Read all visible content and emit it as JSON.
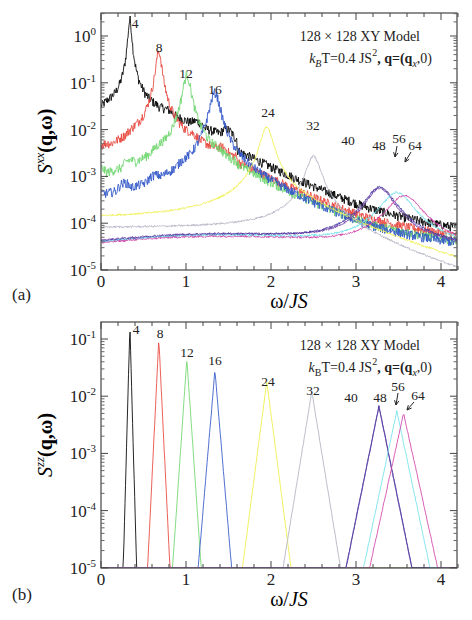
{
  "chart_data": [
    {
      "panel": "(a)",
      "type": "line",
      "title": "",
      "annotation_line1": "128 × 128 XY Model",
      "annotation_line2": "k_B T=0.4 JS², q=(q_x,0)",
      "xlabel": "ω/JS",
      "ylabel": "S^xx(q,ω)",
      "xlim": [
        0,
        4.2
      ],
      "ylim": [
        1e-05,
        3
      ],
      "yscale": "log",
      "xticks": [
        "0",
        "1",
        "2",
        "3",
        "4"
      ],
      "yticks": [
        "10^-5",
        "10^-4",
        "10^-3",
        "10^-2",
        "10^-1",
        "10^0"
      ],
      "grid": false,
      "legend": "inline peak labels (q_x index)",
      "series": [
        {
          "name": "4",
          "color": "#000000",
          "peak_omega": 0.34,
          "peak_value": 2.0,
          "background": 0.003
        },
        {
          "name": "8",
          "color": "#e8453c",
          "peak_omega": 0.68,
          "peak_value": 0.42,
          "background": 0.0008
        },
        {
          "name": "12",
          "color": "#6fd66f",
          "peak_omega": 1.01,
          "peak_value": 0.13,
          "background": 0.0005
        },
        {
          "name": "16",
          "color": "#3056c8",
          "peak_omega": 1.34,
          "peak_value": 0.055,
          "background": 0.00023
        },
        {
          "name": "24",
          "color": "#f0f05a",
          "peak_omega": 1.95,
          "peak_value": 0.011,
          "background": 0.00013
        },
        {
          "name": "32",
          "color": "#b8b8c8",
          "peak_omega": 2.5,
          "peak_value": 0.0026,
          "background": 8e-05
        },
        {
          "name": "40",
          "color": "#6f3fa8",
          "peak_omega": 3.28,
          "peak_value": 0.00052,
          "background": 4.2e-05
        },
        {
          "name": "48",
          "color": "#4a3aa0",
          "peak_omega": 3.28,
          "peak_value": 0.00055,
          "background": 4e-05
        },
        {
          "name": "56",
          "color": "#6ee0ea",
          "peak_omega": 3.48,
          "peak_value": 0.00042,
          "background": 3.9e-05
        },
        {
          "name": "64",
          "color": "#d040a8",
          "peak_omega": 3.57,
          "peak_value": 0.00036,
          "background": 3.7e-05
        }
      ]
    },
    {
      "panel": "(b)",
      "type": "line",
      "title": "",
      "annotation_line1": "128 × 128 XY Model",
      "annotation_line2": "k_B T=0.4 JS², q=(q_x,0)",
      "xlabel": "ω/JS",
      "ylabel": "S^zz(q,ω)",
      "xlim": [
        0,
        4.2
      ],
      "ylim": [
        1e-05,
        0.3
      ],
      "yscale": "log",
      "xticks": [
        "0",
        "1",
        "2",
        "3",
        "4"
      ],
      "yticks": [
        "10^-5",
        "10^-4",
        "10^-3",
        "10^-2",
        "10^-1"
      ],
      "grid": false,
      "legend": "inline peak labels (q_x index)",
      "series": [
        {
          "name": "4",
          "color": "#000000",
          "peak_omega": 0.34,
          "peak_value": 0.17,
          "width": 0.17
        },
        {
          "name": "8",
          "color": "#e8453c",
          "peak_omega": 0.68,
          "peak_value": 0.1,
          "width": 0.3
        },
        {
          "name": "12",
          "color": "#6fd66f",
          "peak_omega": 1.01,
          "peak_value": 0.045,
          "width": 0.42
        },
        {
          "name": "16",
          "color": "#3056c8",
          "peak_omega": 1.34,
          "peak_value": 0.028,
          "width": 0.52
        },
        {
          "name": "24",
          "color": "#f0f05a",
          "peak_omega": 1.95,
          "peak_value": 0.018,
          "width": 0.8
        },
        {
          "name": "32",
          "color": "#b8b8c8",
          "peak_omega": 2.48,
          "peak_value": 0.012,
          "width": 1.0
        },
        {
          "name": "40",
          "color": "#6f3fa8",
          "peak_omega": 3.27,
          "peak_value": 0.0065,
          "width": 1.25
        },
        {
          "name": "48",
          "color": "#4a3aa0",
          "peak_omega": 3.27,
          "peak_value": 0.0068,
          "width": 1.25
        },
        {
          "name": "56",
          "color": "#6ee0ea",
          "peak_omega": 3.48,
          "peak_value": 0.0055,
          "width": 1.3
        },
        {
          "name": "64",
          "color": "#d040a8",
          "peak_omega": 3.56,
          "peak_value": 0.005,
          "width": 1.35
        }
      ]
    }
  ],
  "panels": {
    "a": {
      "label": "(a)",
      "xlabel": "ω/JS",
      "ylabel_main": "S",
      "ylabel_sup": "xx",
      "ylabel_rest": "(q,ω)",
      "annot1": "128 × 128 XY Model",
      "annot2_pre": "k",
      "annot2_sub": "B",
      "annot2_mid": "T=0.4 JS",
      "annot2_sup": "2",
      "annot2_post": ", q=(q",
      "annot2_sub2": "x",
      "annot2_end": ",0)"
    },
    "b": {
      "label": "(b)",
      "xlabel": "ω/JS",
      "ylabel_main": "S",
      "ylabel_sup": "zz",
      "ylabel_rest": "(q,ω)",
      "annot1": "128 × 128 XY Model",
      "annot2_pre": "k",
      "annot2_sub": "B",
      "annot2_mid": "T=0.4 JS",
      "annot2_sup": "2",
      "annot2_post": ", q=(q",
      "annot2_sub2": "x",
      "annot2_end": ",0)"
    }
  }
}
